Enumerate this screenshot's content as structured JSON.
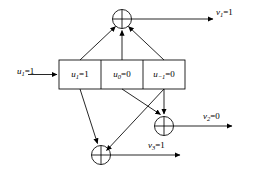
{
  "figure": {
    "width": 253,
    "height": 179,
    "line_color": "#000000",
    "background": "#ffffff"
  },
  "input": {
    "name": "input-u1",
    "var": "u",
    "subscript": "1",
    "value": "1",
    "text": "u1=1"
  },
  "register": {
    "name": "shift-register",
    "cells": [
      {
        "id": "cell-u1",
        "var": "u",
        "subscript": "1",
        "value": "1",
        "text": "u1=1"
      },
      {
        "id": "cell-u0",
        "var": "u",
        "subscript": "0",
        "value": "0",
        "text": "u0=0"
      },
      {
        "id": "cell-um1",
        "var": "u",
        "subscript": "−1",
        "value": "0",
        "text": "u−1=0"
      }
    ]
  },
  "adders": [
    {
      "id": "adder-top",
      "symbol": "⊕",
      "name": "xor-adder-top"
    },
    {
      "id": "adder-middle",
      "symbol": "⊕",
      "name": "xor-adder-middle"
    },
    {
      "id": "adder-bottom",
      "symbol": "⊕",
      "name": "xor-adder-bottom"
    }
  ],
  "outputs": [
    {
      "id": "out-v1",
      "var": "v",
      "subscript": "1",
      "value": "1",
      "text": "v1=1"
    },
    {
      "id": "out-v2",
      "var": "v",
      "subscript": "2",
      "value": "0",
      "text": "v2=0"
    },
    {
      "id": "out-v3",
      "var": "v",
      "subscript": "3",
      "value": "1",
      "text": "v3=1"
    }
  ]
}
